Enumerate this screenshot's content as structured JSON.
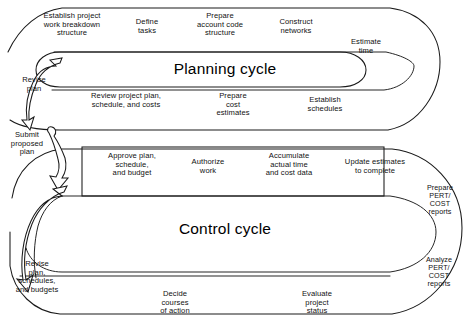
{
  "diagram": {
    "colors": {
      "stroke": "#1a1a1a",
      "background": "#ffffff",
      "text": "#111111"
    },
    "planning_cycle": {
      "title": "Planning cycle",
      "top_row": [
        "Establish project\nwork breakdown\nstructure",
        "Define\ntasks",
        "Prepare\naccount code\nstructure",
        "Construct\nnetworks"
      ],
      "right_label": "Estimate\ntime",
      "bottom_row": [
        "Review project plan,\nschedule, and costs",
        "Prepare\ncost\nestimates",
        "Establish\nschedules"
      ]
    },
    "control_cycle": {
      "title": "Control cycle",
      "top_row": [
        "Approve plan,\nschedule,\nand budget",
        "Authorize\nwork",
        "Accumulate\nactual time\nand cost data",
        "Update estimates\nto complete"
      ],
      "right_labels": [
        "Prepare\nPERT/\nCOST\nreports",
        "Analyze\nPERT/\nCOST\nreports"
      ],
      "bottom_row": [
        "Decide\ncourses\nof action",
        "Evaluate\nproject\nstatus"
      ]
    },
    "connectors": [
      {
        "id": "revise-plan",
        "label": "Revise\nplan"
      },
      {
        "id": "submit-proposed-plan",
        "label": "Submit\nproposed\nplan"
      },
      {
        "id": "revise-plan-schedules-budgets",
        "label": "Revise\nplan,\nschedules,\nand budgets"
      }
    ]
  }
}
